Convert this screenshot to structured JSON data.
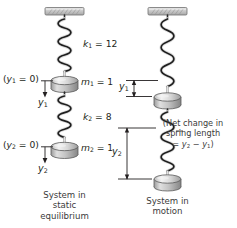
{
  "figure": {
    "type": "physics-diagram",
    "colors": {
      "ink": "#231f20",
      "support_fill": "#cfcfcf",
      "support_edge": "#6e6e6e",
      "mass_fill": "#d9d9d9",
      "mass_edge": "#5a5a5a",
      "spring": "#2b2b2b",
      "background": "#ffffff"
    }
  },
  "left_system": {
    "name": "System in static equilibrium",
    "caption_lines": [
      "System in",
      "static",
      "equilibrium"
    ],
    "spring1": {
      "label": "k",
      "subscript": "1",
      "equals": "=",
      "value": "12",
      "full": "k1 = 12"
    },
    "spring2": {
      "label": "k",
      "subscript": "2",
      "equals": "=",
      "value": "8",
      "full": "k2 = 8"
    },
    "mass1": {
      "label": "m",
      "subscript": "1",
      "equals": "=",
      "value": "1",
      "full": "m1 = 1"
    },
    "mass2": {
      "label": "m",
      "subscript": "2",
      "equals": "=",
      "value": "1",
      "full": "m2 = 1"
    },
    "datum1": {
      "open": "(",
      "label": "y",
      "subscript": "1",
      "equals": "= 0",
      "close": ")",
      "full": "(y1 = 0)"
    },
    "datum2": {
      "open": "(",
      "label": "y",
      "subscript": "2",
      "equals": "= 0",
      "close": ")",
      "full": "(y2 = 0)"
    },
    "axis1": {
      "label": "y",
      "subscript": "1",
      "full": "y1"
    },
    "axis2": {
      "label": "y",
      "subscript": "2",
      "full": "y2"
    }
  },
  "right_system": {
    "name": "System in motion",
    "caption_lines": [
      "System in",
      "motion"
    ],
    "displacement1": {
      "label": "y",
      "subscript": "1",
      "full": "y1"
    },
    "displacement2": {
      "label": "y",
      "subscript": "2",
      "full": "y2"
    },
    "note_lines": [
      "(Net change in",
      "spring length",
      "= y2 − y1)"
    ],
    "note": {
      "line1": "(Net change in",
      "line2": "spring length",
      "line3_prefix": "= ",
      "line3_y2": "y",
      "line3_sub2": "2",
      "line3_minus": " − ",
      "line3_y1": "y",
      "line3_sub1": "1",
      "line3_close": ")"
    }
  }
}
